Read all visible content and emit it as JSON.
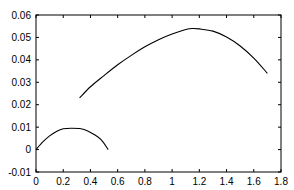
{
  "chart_data": {
    "type": "line",
    "title": "",
    "xlabel": "",
    "ylabel": "",
    "xlim": [
      0,
      1.8
    ],
    "ylim": [
      -0.01,
      0.06
    ],
    "grid": false,
    "legend": null,
    "x_ticks": [
      "0",
      "0.2",
      "0.4",
      "0.6",
      "0.8",
      "1",
      "1.2",
      "1.4",
      "1.6",
      "1.8"
    ],
    "x_tick_values": [
      0,
      0.2,
      0.4,
      0.6,
      0.8,
      1.0,
      1.2,
      1.4,
      1.6,
      1.8
    ],
    "y_ticks": [
      "-0.01",
      "0",
      "0.01",
      "0.02",
      "0.03",
      "0.04",
      "0.05",
      "0.06"
    ],
    "y_tick_values": [
      -0.01,
      0,
      0.01,
      0.02,
      0.03,
      0.04,
      0.05,
      0.06
    ],
    "series": [
      {
        "name": "curve 1",
        "color": "#000000",
        "x": [
          0,
          0.05,
          0.1,
          0.15,
          0.2,
          0.265,
          0.33,
          0.38,
          0.43,
          0.48,
          0.53
        ],
        "y": [
          0,
          0.0034,
          0.0061,
          0.0081,
          0.0093,
          0.0095,
          0.0093,
          0.0083,
          0.0066,
          0.0043,
          0
        ]
      },
      {
        "name": "curve 2",
        "color": "#000000",
        "x": [
          0.32,
          0.4,
          0.5,
          0.6,
          0.7,
          0.8,
          0.9,
          1.0,
          1.1,
          1.15,
          1.2,
          1.3,
          1.4,
          1.5,
          1.6,
          1.7
        ],
        "y": [
          0.023,
          0.028,
          0.033,
          0.0378,
          0.042,
          0.0458,
          0.049,
          0.0515,
          0.0535,
          0.054,
          0.0538,
          0.0528,
          0.0502,
          0.0462,
          0.0408,
          0.034
        ]
      }
    ]
  }
}
